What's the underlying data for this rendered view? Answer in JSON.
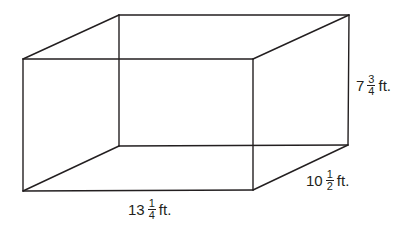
{
  "figure": {
    "type": "rectangular-prism-wireframe",
    "stroke_color": "#231f20",
    "background": "#ffffff",
    "vertices": {
      "front_top_left": [
        23,
        59
      ],
      "front_top_right": [
        253,
        59
      ],
      "front_bottom_left": [
        23,
        191
      ],
      "front_bottom_right": [
        253,
        190
      ],
      "back_top_left": [
        119,
        15
      ],
      "back_top_right": [
        349,
        15
      ],
      "back_bottom_left": [
        119,
        146
      ],
      "back_bottom_right": [
        348,
        145
      ]
    }
  },
  "labels": {
    "length": {
      "whole": "13",
      "numerator": "1",
      "denominator": "4",
      "unit": "ft."
    },
    "width": {
      "whole": "10",
      "numerator": "1",
      "denominator": "2",
      "unit": "ft."
    },
    "height": {
      "whole": "7",
      "numerator": "3",
      "denominator": "4",
      "unit": "ft."
    }
  }
}
